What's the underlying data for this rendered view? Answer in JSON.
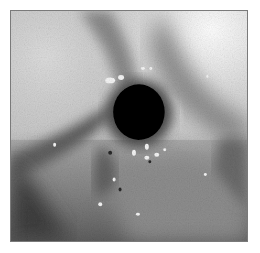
{
  "image": {
    "kind": "grayscale endoscopic photograph",
    "subject": "dark circular lumen opening surrounded by mucosal tissue",
    "colors": {
      "background": "#ffffff",
      "frame_border": "#7a7a7a",
      "lumen": "#050505",
      "highlight": "#f4f4f4",
      "light_region": "#e6e6e6",
      "mid_tissue": "#8e8e8e",
      "dark_tissue": "#3c3c3c"
    },
    "frame": {
      "x": 10,
      "y": 10,
      "width": 238,
      "height": 232
    },
    "lumen": {
      "cx": 139,
      "cy": 112,
      "rx": 27,
      "ry": 29
    }
  }
}
